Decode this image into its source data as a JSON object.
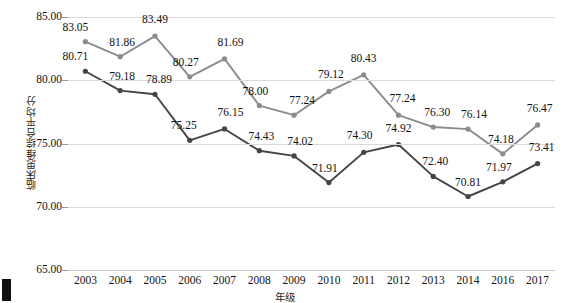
{
  "chart_data": {
    "type": "line",
    "title": "",
    "xlabel": "年级",
    "ylabel": "临床思维综合平均分",
    "categories": [
      "2003",
      "2004",
      "2005",
      "2006",
      "2007",
      "2008",
      "2009",
      "2010",
      "2011",
      "2012",
      "2013",
      "2014",
      "2016",
      "2017"
    ],
    "ylim": [
      65,
      85
    ],
    "ytick_labels": [
      "85.00",
      "80.00",
      "75.00",
      "70.00",
      "65.00"
    ],
    "yticks": [
      85,
      80,
      75,
      70,
      65
    ],
    "grid": true,
    "legend": "none",
    "series": [
      {
        "name": "upper-series",
        "color": "#8c8c8c",
        "values": [
          83.05,
          81.86,
          83.49,
          80.27,
          81.69,
          78.0,
          77.24,
          79.12,
          80.43,
          77.24,
          76.3,
          76.14,
          74.18,
          76.47
        ],
        "labels": [
          "83.05",
          "81.86",
          "83.49",
          "80.27",
          "81.69",
          "78.00",
          "77.24",
          "79.12",
          "80.43",
          "77.24",
          "76.30",
          "76.14",
          "74.18",
          "76.47"
        ]
      },
      {
        "name": "lower-series",
        "color": "#454545",
        "values": [
          80.71,
          79.18,
          78.89,
          75.25,
          76.15,
          74.43,
          74.02,
          71.91,
          74.3,
          74.92,
          72.4,
          70.81,
          71.97,
          73.41
        ],
        "labels": [
          "80.71",
          "79.18",
          "78.89",
          "75.25",
          "76.15",
          "74.43",
          "74.02",
          "71.91",
          "74.30",
          "74.92",
          "72.40",
          "70.81",
          "71.97",
          "73.41"
        ]
      }
    ]
  }
}
